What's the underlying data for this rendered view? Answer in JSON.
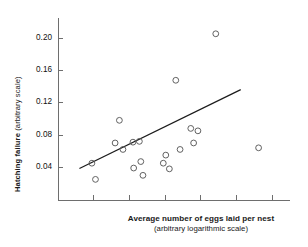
{
  "chart_data": {
    "type": "scatter",
    "title": "",
    "xlabel": "Average number of eggs laid per nest",
    "xlabel_sub": "(arbitrary logarithmic scale)",
    "ylabel": "Hatching failure",
    "ylabel_sub": "(arbitrary scale)",
    "ylabel_full": "Hatching failure (arbitrary scale)",
    "grid": false,
    "legend": "none",
    "xlim": [
      0,
      6.5
    ],
    "ylim": [
      0.0,
      0.225
    ],
    "yticks": [
      0.04,
      0.08,
      0.12,
      0.16,
      0.2
    ],
    "ytick_labels": [
      "0.04",
      "0.08",
      "0.12",
      "0.16",
      "0.20"
    ],
    "xticks": [
      1,
      2,
      3,
      4,
      5,
      6
    ],
    "xtick_labels": [
      "",
      "",
      "",
      "",
      "",
      ""
    ],
    "marker": "open-circle",
    "marker_color": "#5a5a5a",
    "axis_color": "#6e6e6e",
    "line_color": "#1c1c1c",
    "points": [
      {
        "x": 0.95,
        "y": 0.0455
      },
      {
        "x": 1.05,
        "y": 0.0255
      },
      {
        "x": 1.6,
        "y": 0.0705
      },
      {
        "x": 1.72,
        "y": 0.0985
      },
      {
        "x": 1.82,
        "y": 0.0625
      },
      {
        "x": 2.1,
        "y": 0.0715
      },
      {
        "x": 2.12,
        "y": 0.0395
      },
      {
        "x": 2.28,
        "y": 0.0725
      },
      {
        "x": 2.32,
        "y": 0.0475
      },
      {
        "x": 2.38,
        "y": 0.0305
      },
      {
        "x": 2.95,
        "y": 0.0455
      },
      {
        "x": 3.02,
        "y": 0.0555
      },
      {
        "x": 3.12,
        "y": 0.0385
      },
      {
        "x": 3.3,
        "y": 0.148
      },
      {
        "x": 3.42,
        "y": 0.0625
      },
      {
        "x": 3.72,
        "y": 0.0885
      },
      {
        "x": 3.8,
        "y": 0.0705
      },
      {
        "x": 3.92,
        "y": 0.0855
      },
      {
        "x": 4.42,
        "y": 0.2055
      },
      {
        "x": 5.62,
        "y": 0.0645
      }
    ],
    "trend_line": {
      "x_start": 0.6,
      "y_start": 0.039,
      "x_end": 5.12,
      "y_end": 0.1365
    }
  }
}
